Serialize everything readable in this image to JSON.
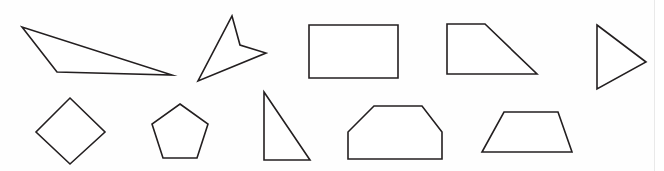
{
  "canvas": {
    "width": 664,
    "height": 171,
    "background_color": "#fefefe",
    "stroke_color": "#231f20",
    "fill_color": "#ffffff",
    "stroke_width": 1.6,
    "title": "Geometric Shapes Worksheet",
    "rows": 2,
    "shape_count": 9
  },
  "shapes": [
    {
      "id": "shape-1",
      "name": "obtuse-scalene-triangle",
      "label": "Triangle",
      "sides": 3,
      "row": 1,
      "column": 1,
      "points": "22,27 57,72 172,75"
    },
    {
      "id": "shape-2",
      "name": "concave-dart-arrowhead",
      "label": "Arrowhead",
      "sides": 4,
      "row": 1,
      "column": 2,
      "points": "232,16 240,45 266,53 198,81"
    },
    {
      "id": "shape-3",
      "name": "rectangle",
      "label": "Rectangle",
      "sides": 4,
      "row": 1,
      "column": 3,
      "points": "309,25 398,25 398,78 309,78"
    },
    {
      "id": "shape-4",
      "name": "right-trapezoid",
      "label": "Right trapezoid",
      "sides": 4,
      "row": 1,
      "column": 4,
      "points": "447,24 485,24 537,74 447,74"
    },
    {
      "id": "shape-5",
      "name": "right-pointing-triangle",
      "label": "Triangle",
      "sides": 3,
      "row": 1,
      "column": 5,
      "points": "597,25 646,62 597,89"
    },
    {
      "id": "shape-6",
      "name": "rhombus-diamond",
      "label": "Rhombus",
      "sides": 4,
      "row": 2,
      "column": 1,
      "points": "70,98 105,132 70,164 36,132"
    },
    {
      "id": "shape-7",
      "name": "regular-pentagon",
      "label": "Pentagon",
      "sides": 5,
      "row": 2,
      "column": 2,
      "points": "180,104 208,124 197,158 163,158 152,124"
    },
    {
      "id": "shape-8",
      "name": "right-triangle",
      "label": "Right triangle",
      "sides": 3,
      "row": 2,
      "column": 3,
      "points": "264,92 310,160 264,160"
    },
    {
      "id": "shape-9",
      "name": "irregular-hexagon",
      "label": "Hexagon",
      "sides": 6,
      "row": 2,
      "column": 4,
      "points": "374,106 422,106 442,132 442,159 348,159 348,132"
    },
    {
      "id": "shape-10",
      "name": "isosceles-trapezoid",
      "label": "Trapezoid",
      "sides": 4,
      "row": 2,
      "column": 5,
      "points": "504,112 558,112 572,152 482,152"
    }
  ]
}
